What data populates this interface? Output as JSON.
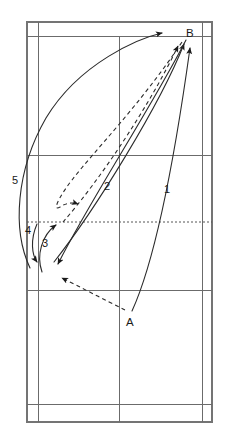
{
  "diagram": {
    "type": "court-trajectory-diagram",
    "colors": {
      "court_line": "#6b6b6b",
      "trajectory": "#2b2b2b",
      "background": "#ffffff",
      "net_line": "#555555"
    }
  },
  "points": {
    "a": {
      "label": "A",
      "x": 130,
      "y": 321
    },
    "b": {
      "label": "B",
      "x": 192,
      "y": 33
    }
  },
  "shot_labels": [
    {
      "id": "1",
      "label": "1",
      "x": 167,
      "y": 189,
      "style": "solid",
      "description": "A to B straight clear"
    },
    {
      "id": "2",
      "label": "2",
      "x": 107,
      "y": 186,
      "style": "solid",
      "description": "net area to B cross clear"
    },
    {
      "id": "3",
      "label": "3",
      "x": 45,
      "y": 243,
      "style": "solid",
      "description": "short net lift"
    },
    {
      "id": "4",
      "label": "4",
      "x": 29,
      "y": 232,
      "style": "solid",
      "description": "net drop return"
    },
    {
      "id": "5",
      "label": "5",
      "x": 16,
      "y": 180,
      "style": "solid",
      "description": "long sideline loop to B"
    }
  ],
  "court_geometry": {
    "outer_left": 27,
    "inner_left": 38,
    "center_line": 119,
    "inner_right": 202,
    "outer_right": 212,
    "top": 22,
    "top_doubles_service": 36,
    "mid_service": 155,
    "net_line_y": 222,
    "lower_service": 290,
    "bottom_doubles_service": 404,
    "bottom": 422
  },
  "net": {
    "style": "dotted",
    "y": 222
  },
  "legend": {
    "solid_meaning": "Shuttle trajectory (solid)",
    "dashed_meaning": "Shuttle trajectory (dashed)"
  }
}
